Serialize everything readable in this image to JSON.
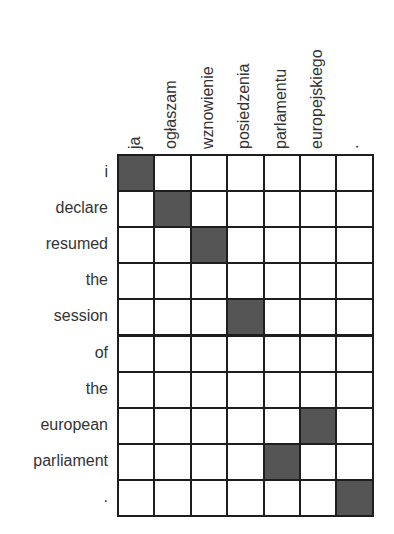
{
  "chart_data": {
    "type": "heatmap",
    "title": "",
    "x_tokens": [
      "ja",
      "ogłaszam",
      "wznowienie",
      "posiedzenia",
      "parlamentu",
      "europejskiego",
      "."
    ],
    "y_tokens": [
      "i",
      "declare",
      "resumed",
      "the",
      "session",
      "of",
      "the",
      "european",
      "parliament",
      "."
    ],
    "alignments": [
      {
        "row": 0,
        "col": 0
      },
      {
        "row": 1,
        "col": 1
      },
      {
        "row": 2,
        "col": 2
      },
      {
        "row": 4,
        "col": 3
      },
      {
        "row": 7,
        "col": 5
      },
      {
        "row": 8,
        "col": 4
      },
      {
        "row": 9,
        "col": 6
      }
    ],
    "fill_color": "#555555",
    "empty_color": "#ffffff",
    "grid": true
  }
}
